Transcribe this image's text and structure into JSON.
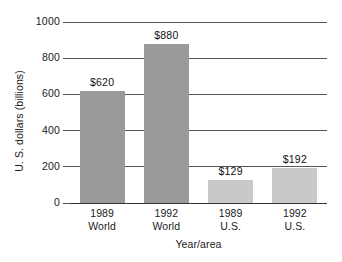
{
  "chart_data": {
    "type": "bar",
    "title": "",
    "xlabel": "Year/area",
    "ylabel": "U. S. dollars (billions)",
    "categories": [
      "1989 World",
      "1992 World",
      "1989 U.S.",
      "1992 U.S."
    ],
    "category_lines": [
      [
        "1989",
        "World"
      ],
      [
        "1992",
        "World"
      ],
      [
        "1989",
        "U.S."
      ],
      [
        "1992",
        "U.S."
      ]
    ],
    "values": [
      620,
      880,
      129,
      192
    ],
    "value_labels": [
      "$620",
      "$880",
      "$129",
      "$192"
    ],
    "bar_colors": [
      "#9a9a9a",
      "#9a9a9a",
      "#c9c9c9",
      "#c9c9c9"
    ],
    "ylim": [
      0,
      1000
    ],
    "yticks": [
      1000,
      800,
      600,
      400,
      200,
      0
    ],
    "ytick_labels": [
      "1000",
      "800",
      "600",
      "400",
      "200",
      "0"
    ],
    "grid": true,
    "grid_axis": "y",
    "legend": "none",
    "background_color": "#ffffff",
    "axis_color": "#555555"
  }
}
